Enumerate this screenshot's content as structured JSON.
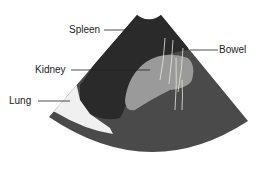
{
  "diagram": {
    "type": "ultrasound-anatomy-illustration",
    "labels": [
      {
        "id": "spleen",
        "text": "Spleen"
      },
      {
        "id": "kidney",
        "text": "Kidney"
      },
      {
        "id": "lung",
        "text": "Lung"
      },
      {
        "id": "bowel",
        "text": "Bowel"
      }
    ],
    "colors": {
      "background": "#ffffff",
      "fan_tissue": "#4a4a4a",
      "spleen": "#2a2a2a",
      "kidney": "#9a9a9a",
      "lung": "#f0f0f0",
      "leader_line": "#222222",
      "label_text": "#222222"
    }
  }
}
